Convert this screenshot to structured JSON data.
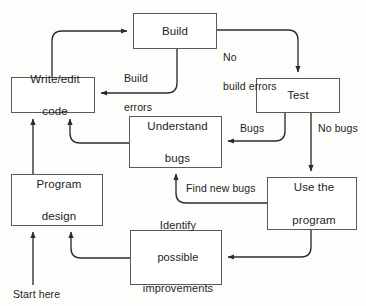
{
  "diagram": {
    "colors": {
      "box_border": "#5a5a58",
      "box_fill": "#ffffff",
      "arrow": "#2b2b2b",
      "text": "#1d1d1b",
      "page_background": "#fdfdfc"
    },
    "nodes": [
      {
        "id": "build",
        "label": "Build",
        "x": 133,
        "y": 13,
        "w": 84,
        "h": 36
      },
      {
        "id": "write_edit_code",
        "label": "Write/edit\ncode",
        "line1": "Write/edit",
        "line2": "code",
        "x": 11,
        "y": 77,
        "w": 84,
        "h": 36
      },
      {
        "id": "test",
        "label": "Test",
        "x": 256,
        "y": 78,
        "w": 84,
        "h": 35
      },
      {
        "id": "understand_bugs",
        "label": "Understand\nbugs",
        "line1": "Understand",
        "line2": "bugs",
        "x": 129,
        "y": 116,
        "w": 93,
        "h": 52
      },
      {
        "id": "program_design",
        "label": "Program\ndesign",
        "line1": "Program",
        "line2": "design",
        "x": 11,
        "y": 174,
        "w": 92,
        "h": 52
      },
      {
        "id": "use_the_program",
        "label": "Use the\nprogram",
        "line1": "Use the",
        "line2": "program",
        "x": 267,
        "y": 177,
        "w": 90,
        "h": 53
      },
      {
        "id": "identify_possible_improvements",
        "label": "Identify\npossible\nimprovements",
        "line1": "Identify",
        "line2": "possible",
        "line3": "improvements",
        "x": 130,
        "y": 230,
        "w": 92,
        "h": 55
      }
    ],
    "edges": [
      {
        "id": "write-to-build",
        "from": "write_edit_code",
        "to": "build",
        "label": ""
      },
      {
        "id": "build-to-test",
        "from": "build",
        "to": "test",
        "label": "No\nbuild errors",
        "label_line1": "No",
        "label_line2": "build errors"
      },
      {
        "id": "build-to-write",
        "from": "build",
        "to": "write_edit_code",
        "label": "Build\nerrors",
        "label_line1": "Build",
        "label_line2": "errors"
      },
      {
        "id": "test-to-understand",
        "from": "test",
        "to": "understand_bugs",
        "label": "Bugs"
      },
      {
        "id": "test-to-use",
        "from": "test",
        "to": "use_the_program",
        "label": "No bugs"
      },
      {
        "id": "understand-to-write",
        "from": "understand_bugs",
        "to": "write_edit_code",
        "label": ""
      },
      {
        "id": "use-to-understand",
        "from": "use_the_program",
        "to": "understand_bugs",
        "label": "Find new bugs"
      },
      {
        "id": "use-to-identify",
        "from": "use_the_program",
        "to": "identify_possible_improvements",
        "label": ""
      },
      {
        "id": "identify-to-program-design",
        "from": "identify_possible_improvements",
        "to": "program_design",
        "label": ""
      },
      {
        "id": "program-design-to-write",
        "from": "program_design",
        "to": "write_edit_code",
        "label": ""
      },
      {
        "id": "start-to-program-design",
        "from": "start",
        "to": "program_design",
        "label": "Start here"
      }
    ],
    "labels": {
      "no_build_errors_l1": "No",
      "no_build_errors_l2": "build errors",
      "build_errors_l1": "Build",
      "build_errors_l2": "errors",
      "bugs": "Bugs",
      "no_bugs": "No bugs",
      "find_new_bugs": "Find new bugs",
      "start_here": "Start here"
    }
  }
}
